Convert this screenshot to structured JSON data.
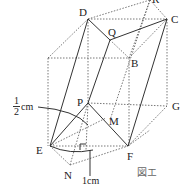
{
  "figure": {
    "caption": "図エ",
    "points": {
      "D": "D",
      "C": "C",
      "R": "R",
      "Q": "Q",
      "B": "B",
      "P": "P",
      "M": "M",
      "E": "E",
      "F": "F",
      "G": "G",
      "N": "N"
    },
    "annotations": {
      "half_cm_num": "1",
      "half_cm_den": "2",
      "half_cm_unit": "cm",
      "one_cm": "1cm"
    }
  }
}
